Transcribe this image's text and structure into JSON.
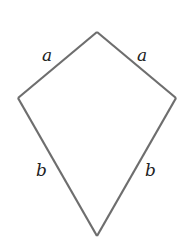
{
  "diagram": {
    "type": "kite",
    "vertices": {
      "top": [
        97,
        32
      ],
      "left": [
        18,
        98
      ],
      "right": [
        176,
        98
      ],
      "bottom": [
        97,
        236
      ]
    },
    "stroke_color": "#6e6e6e",
    "background": "#ffffff",
    "labels": [
      {
        "id": "upper-left",
        "text": "a",
        "x": 42,
        "y": 61
      },
      {
        "id": "upper-right",
        "text": "a",
        "x": 137,
        "y": 61
      },
      {
        "id": "lower-left",
        "text": "b",
        "x": 36,
        "y": 176
      },
      {
        "id": "lower-right",
        "text": "b",
        "x": 145,
        "y": 176
      }
    ]
  }
}
